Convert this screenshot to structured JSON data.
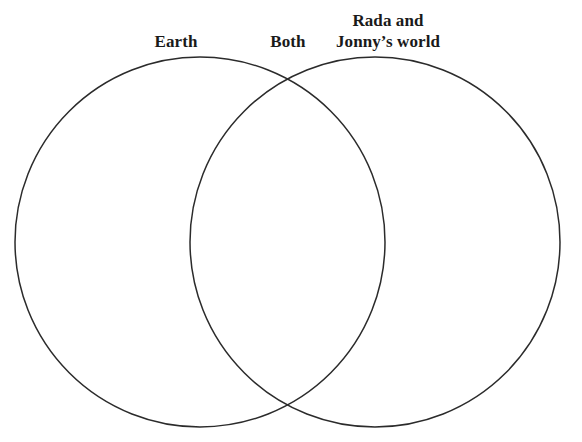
{
  "page": {
    "type": "venn-diagram",
    "background_color": "#ffffff",
    "stroke_color": "#2b2b2b",
    "text_color": "#1a1a1a"
  },
  "labels": {
    "left": "Earth",
    "center": "Both",
    "right_line_1": "Rada and",
    "right_line_2": "Jonny’s world"
  },
  "diagram": {
    "left_circle": {
      "label": "Earth",
      "center_x": 200,
      "center_y": 242,
      "radius": 185
    },
    "right_circle": {
      "label": "Rada and Jonny’s world",
      "center_x": 375,
      "center_y": 242,
      "radius": 185
    },
    "overlap_label": "Both",
    "stroke_width": 1.5
  }
}
